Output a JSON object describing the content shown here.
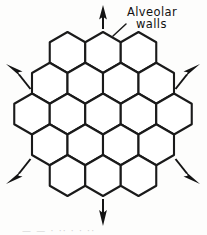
{
  "figure": {
    "background_color": "#fdfdfc",
    "line_color": "#1a1a1a",
    "arrow_color": "#141414",
    "cell_fill": "#ffffff"
  },
  "labels": {
    "alveolar_walls_line_1": "Alveolar",
    "alveolar_walls_line_2": "walls",
    "leader_target": "alveolar-wall-segment"
  },
  "caption": {
    "cropped_remnant": "— —   · ·· ·   · ··"
  },
  "honeycomb": {
    "orientation": "pointy-top",
    "cell_count": 19,
    "rows": [
      {
        "index": 0,
        "cells": 3
      },
      {
        "index": 1,
        "cells": 4
      },
      {
        "index": 2,
        "cells": 5
      },
      {
        "index": 3,
        "cells": 4
      },
      {
        "index": 4,
        "cells": 3
      }
    ],
    "hex_radius": 20.5,
    "center_x": 103,
    "center_y": 114,
    "cell_label": "alveolus"
  },
  "forces": {
    "count": 6,
    "description": "radial outward traction arrows",
    "items": [
      {
        "name": "force-arrow-up",
        "direction": "up",
        "angle_deg": 270
      },
      {
        "name": "force-arrow-up-right",
        "direction": "up-right",
        "angle_deg": 330
      },
      {
        "name": "force-arrow-down-right",
        "direction": "down-right",
        "angle_deg": 30
      },
      {
        "name": "force-arrow-down",
        "direction": "down",
        "angle_deg": 90
      },
      {
        "name": "force-arrow-down-left",
        "direction": "down-left",
        "angle_deg": 150
      },
      {
        "name": "force-arrow-up-left",
        "direction": "up-left",
        "angle_deg": 210
      }
    ]
  }
}
